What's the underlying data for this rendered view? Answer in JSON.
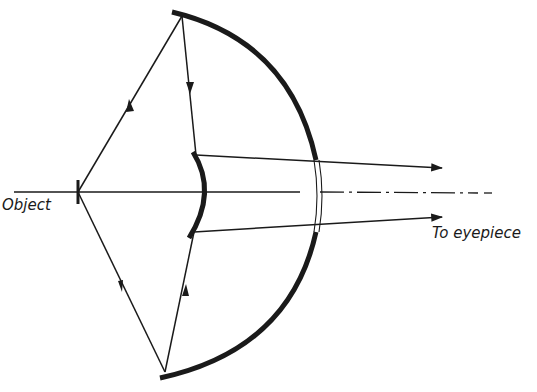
{
  "diagram": {
    "labels": {
      "object": "Object",
      "eyepiece": "To eyepiece"
    },
    "colors": {
      "ink": "#1a1a1a",
      "background": "#ffffff"
    },
    "elements": {
      "primary_mirror": "concave primary mirror with central aperture",
      "secondary_mirror": "convex secondary mirror",
      "optical_axis": "dash-dot optical axis",
      "rays": [
        "upper marginal ray",
        "lower marginal ray"
      ]
    }
  }
}
